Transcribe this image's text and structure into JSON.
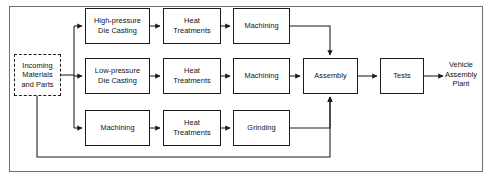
{
  "diagram": {
    "frame": {
      "visible": true,
      "color": "#6e6e6e"
    },
    "line_color": "#1a1a1a",
    "background": "#ffffff",
    "source_node": {
      "id": "incoming",
      "label": "Incoming\nMaterials\nand Parts",
      "border_style": "dashed",
      "x": 14,
      "y": 54,
      "w": 47,
      "h": 42
    },
    "rows": [
      {
        "name": "high-pressure-line",
        "y": 8,
        "h": 36,
        "nodes": [
          {
            "id": "hp-die-casting",
            "label": "High-pressure\nDie Casting",
            "x": 85,
            "w": 65
          },
          {
            "id": "hp-heat-treatments",
            "label": "Heat\nTreatments",
            "x": 163,
            "w": 58
          },
          {
            "id": "hp-machining",
            "label": "Machining",
            "x": 233,
            "w": 57
          }
        ]
      },
      {
        "name": "low-pressure-line",
        "y": 58,
        "h": 36,
        "nodes": [
          {
            "id": "lp-die-casting",
            "label": "Low-pressure\nDie Casting",
            "x": 85,
            "w": 65
          },
          {
            "id": "lp-heat-treatments",
            "label": "Heat\nTreatments",
            "x": 163,
            "w": 58
          },
          {
            "id": "lp-machining",
            "label": "Machining",
            "x": 233,
            "w": 57
          }
        ]
      },
      {
        "name": "machining-line",
        "y": 110,
        "h": 36,
        "nodes": [
          {
            "id": "mc-machining",
            "label": "Machining",
            "x": 85,
            "w": 65
          },
          {
            "id": "mc-heat-treatments",
            "label": "Heat\nTreatments",
            "x": 163,
            "w": 58
          },
          {
            "id": "mc-grinding",
            "label": "Grinding",
            "x": 233,
            "w": 57
          }
        ]
      }
    ],
    "downstream": [
      {
        "id": "assembly",
        "label": "Assembly",
        "x": 303,
        "y": 58,
        "w": 55,
        "h": 36
      },
      {
        "id": "tests",
        "label": "Tests",
        "x": 380,
        "y": 58,
        "w": 44,
        "h": 36
      }
    ],
    "sink_label": {
      "id": "vehicle-assembly-plant",
      "label": "Vehicle\nAssembly\nPlant",
      "x": 437,
      "y": 60,
      "w": 48
    }
  }
}
